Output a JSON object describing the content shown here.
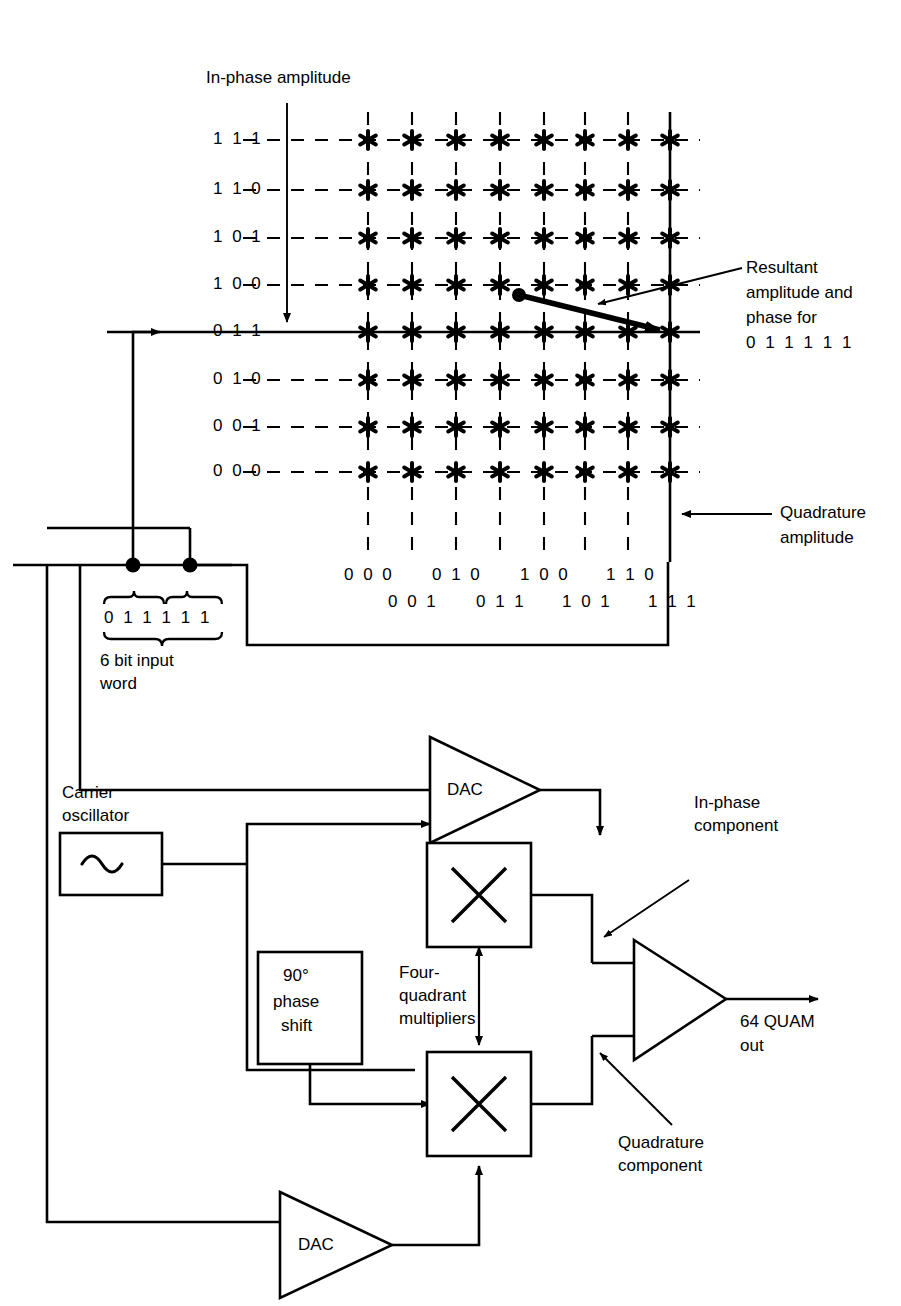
{
  "figure": {
    "title_annotations": {
      "in_phase_amplitude": "In-phase amplitude",
      "quadrature_amplitude_line1": "Quadrature",
      "quadrature_amplitude_line2": "amplitude",
      "resultant_line1": "Resultant",
      "resultant_line2": "amplitude and",
      "resultant_line3": "phase for",
      "resultant_line4": "0 1 1 1 1 1"
    },
    "constellation": {
      "type": "scatter",
      "marker": "six-point-asterisk",
      "rows": 8,
      "cols": 8,
      "y_labels": [
        "1 1 1",
        "1 1 0",
        "1 0 1",
        "1 0 0",
        "0 1 1",
        "0 1 0",
        "0 0 1",
        "0 0 0"
      ],
      "x_labels_top": [
        "0 0 0",
        "0 1 0",
        "1 0 0",
        "1 1 0"
      ],
      "x_labels_bottom": [
        "0 0 1",
        "0 1 1",
        "1 0 1",
        "1 1 1"
      ],
      "highlighted_row": "0 1 1",
      "highlighted_col": "1 1 1",
      "selected_point": {
        "i": "0 1 1",
        "q": "1 1 1",
        "word": "0 1 1 1 1 1"
      }
    },
    "input": {
      "word_bits": "0 1 1 1 1 1",
      "word_caption_line1": "6 bit input",
      "word_caption_line2": "word",
      "group_i": "0 1 1",
      "group_q": "1 1 1"
    },
    "blocks": {
      "dac_top": "DAC",
      "dac_bottom": "DAC",
      "carrier_label_line1": "Carrier",
      "carrier_label_line2": "oscillator",
      "oscillator_symbol": "sine-wave-icon",
      "phase_shift_line1": "90°",
      "phase_shift_line2": "phase",
      "phase_shift_line3": "shift",
      "multiplier_symbol": "multiply-icon",
      "multiplier_caption_line1": "Four-",
      "multiplier_caption_line2": "quadrant",
      "multiplier_caption_line3": "multipliers",
      "in_phase_component_line1": "In-phase",
      "in_phase_component_line2": "component",
      "quadrature_component_line1": "Quadrature",
      "quadrature_component_line2": "component",
      "output_line1": "64 QUAM",
      "output_line2": "out",
      "summer_symbol": "summing-amplifier-icon"
    },
    "colors": {
      "ink": "#000000",
      "paper": "#ffffff"
    }
  }
}
